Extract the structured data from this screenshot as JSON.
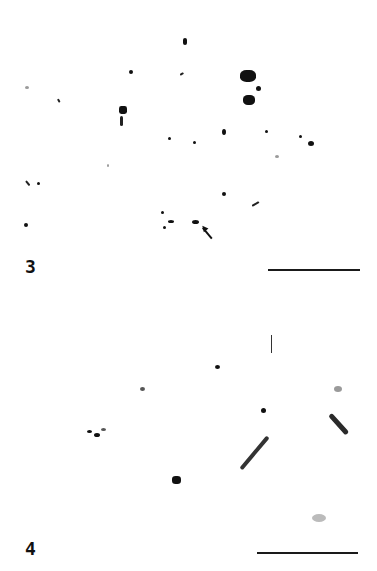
{
  "figure": {
    "panels": [
      {
        "label": "3",
        "scale_bar": "scale bar (unlabeled)",
        "annotation": "arrow pointing to chromosome pair"
      },
      {
        "label": "4",
        "scale_bar": "scale bar (unlabeled)",
        "annotation": "vertical tick mark"
      }
    ],
    "colors": {
      "background": "#ffffff",
      "stain": "#111111"
    }
  }
}
